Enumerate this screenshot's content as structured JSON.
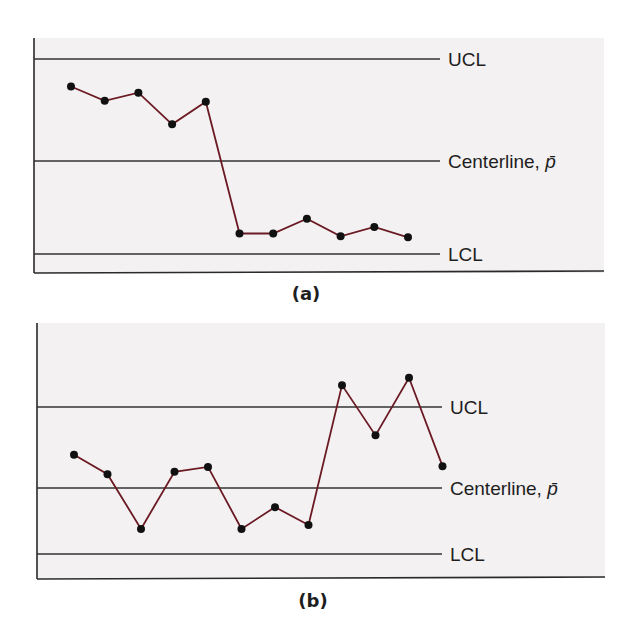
{
  "figure": {
    "panels": [
      {
        "id": "a",
        "caption": "(a)",
        "labels": {
          "ucl": "UCL",
          "centerline": "Centerline, ",
          "centerline_symbol": "p̄",
          "lcl": "LCL"
        }
      },
      {
        "id": "b",
        "caption": "(b)",
        "labels": {
          "ucl": "UCL",
          "centerline": "Centerline, ",
          "centerline_symbol": "p̄",
          "lcl": "LCL"
        }
      }
    ],
    "colors": {
      "panel_background": "#f3f1f1",
      "axis": "#2a2a2a",
      "limit_line": "#333333",
      "series_line": "#6b1a24",
      "marker": "#111111"
    }
  },
  "chart_data": [
    {
      "type": "line",
      "title": "(a)",
      "xlabel": "",
      "ylabel": "",
      "grid": false,
      "y_scale_note": "normalized: centerline = 0, UCL = +1, LCL = -1",
      "reference_lines": [
        {
          "name": "UCL",
          "value": 1.0
        },
        {
          "name": "Centerline, p̄",
          "value": 0.0
        },
        {
          "name": "LCL",
          "value": -1.0
        }
      ],
      "x": [
        1,
        2,
        3,
        4,
        5,
        6,
        7,
        8,
        9,
        10,
        11
      ],
      "series": [
        {
          "name": "sample proportion",
          "values": [
            0.73,
            0.59,
            0.67,
            0.36,
            0.58,
            -0.78,
            -0.78,
            -0.62,
            -0.81,
            -0.71,
            -0.82
          ]
        }
      ],
      "ylim": [
        -1.2,
        1.2
      ]
    },
    {
      "type": "line",
      "title": "(b)",
      "xlabel": "",
      "ylabel": "",
      "grid": false,
      "y_scale_note": "normalized: centerline = 0, UCL = +1, LCL = -1",
      "reference_lines": [
        {
          "name": "UCL",
          "value": 1.0
        },
        {
          "name": "Centerline, p̄",
          "value": 0.0
        },
        {
          "name": "LCL",
          "value": -1.0
        }
      ],
      "x": [
        1,
        2,
        3,
        4,
        5,
        6,
        7,
        8,
        9,
        10,
        11,
        12
      ],
      "series": [
        {
          "name": "sample proportion",
          "values": [
            0.41,
            0.17,
            -0.62,
            0.2,
            0.26,
            -0.62,
            -0.29,
            -0.56,
            1.27,
            0.65,
            1.36,
            0.27
          ]
        }
      ],
      "ylim": [
        -1.4,
        1.8
      ]
    }
  ]
}
